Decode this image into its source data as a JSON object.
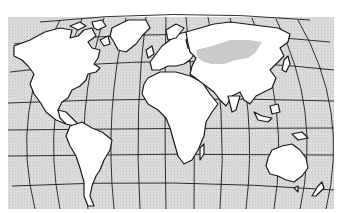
{
  "map": {
    "title": "",
    "projection": "world map with curved graticule (meridians and parallels)",
    "background_color": "#d9d9d9",
    "land_color": "#ffffff",
    "outline_color": "#1a1a1a",
    "highlight_color": "#c9c9c9",
    "highlighted_region": "Central/northern Eurasia (shaded grey band)",
    "continents": [
      "North America",
      "South America",
      "Europe",
      "Africa",
      "Asia",
      "Australia",
      "Greenland"
    ],
    "labels": []
  }
}
